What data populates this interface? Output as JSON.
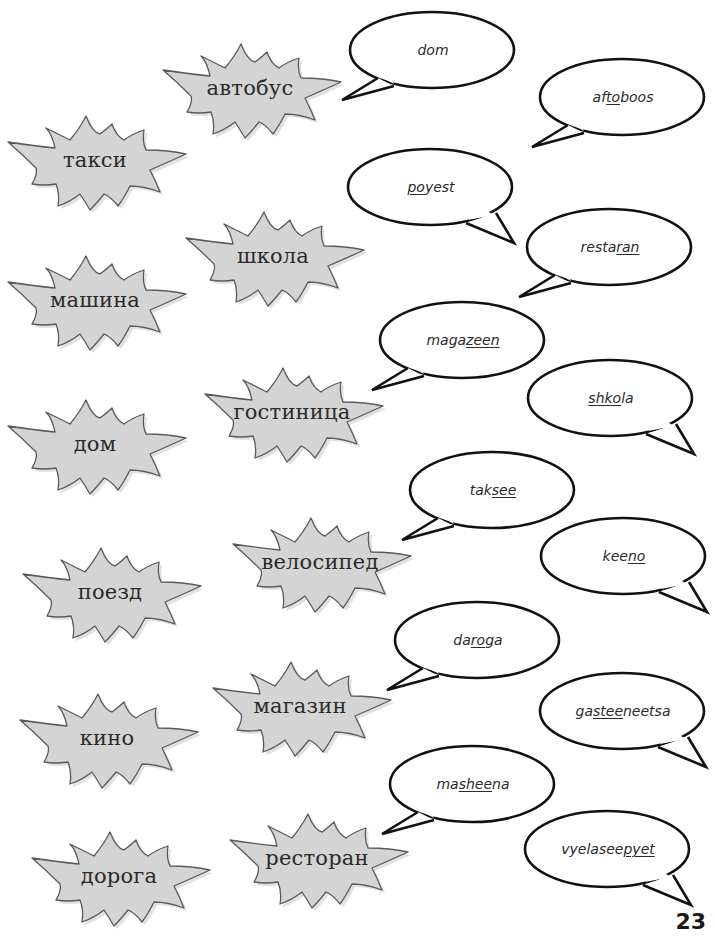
{
  "page": {
    "number": "23",
    "colors": {
      "star_fill": "#d4d4d4",
      "star_stroke": "#5a5a5a",
      "bubble_fill": "#ffffff",
      "bubble_stroke": "#111111",
      "text": "#2b2b2b"
    }
  },
  "russian_words": [
    {
      "text": "автобус",
      "x": 155,
      "y": 38
    },
    {
      "text": "такси",
      "x": 0,
      "y": 110
    },
    {
      "text": "школа",
      "x": 178,
      "y": 206
    },
    {
      "text": "машина",
      "x": 0,
      "y": 250
    },
    {
      "text": "гостиница",
      "x": 197,
      "y": 362
    },
    {
      "text": "дом",
      "x": 0,
      "y": 394
    },
    {
      "text": "велосипед",
      "x": 225,
      "y": 512
    },
    {
      "text": "поезд",
      "x": 15,
      "y": 542
    },
    {
      "text": "магазин",
      "x": 205,
      "y": 656
    },
    {
      "text": "кино",
      "x": 12,
      "y": 688
    },
    {
      "text": "ресторан",
      "x": 222,
      "y": 808
    },
    {
      "text": "дорога",
      "x": 24,
      "y": 826
    }
  ],
  "pronunciations": [
    {
      "parts": [
        {
          "t": "dom",
          "u": false
        }
      ],
      "x": 348,
      "y": 10,
      "tail": "left"
    },
    {
      "parts": [
        {
          "t": "af",
          "u": false
        },
        {
          "t": "to",
          "u": true
        },
        {
          "t": "boos",
          "u": false
        }
      ],
      "x": 538,
      "y": 57,
      "tail": "left"
    },
    {
      "parts": [
        {
          "t": "po",
          "u": true
        },
        {
          "t": "yest",
          "u": false
        }
      ],
      "x": 346,
      "y": 147,
      "tail": "right"
    },
    {
      "parts": [
        {
          "t": "resta",
          "u": false
        },
        {
          "t": "ran",
          "u": true
        }
      ],
      "x": 525,
      "y": 207,
      "tail": "left"
    },
    {
      "parts": [
        {
          "t": "maga",
          "u": false
        },
        {
          "t": "zeen",
          "u": true
        }
      ],
      "x": 378,
      "y": 300,
      "tail": "left"
    },
    {
      "parts": [
        {
          "t": "shko",
          "u": true
        },
        {
          "t": "la",
          "u": false
        }
      ],
      "x": 526,
      "y": 358,
      "tail": "right"
    },
    {
      "parts": [
        {
          "t": "tak",
          "u": false
        },
        {
          "t": "see",
          "u": true
        }
      ],
      "x": 408,
      "y": 450,
      "tail": "left"
    },
    {
      "parts": [
        {
          "t": "kee",
          "u": false
        },
        {
          "t": "no",
          "u": true
        }
      ],
      "x": 539,
      "y": 516,
      "tail": "right"
    },
    {
      "parts": [
        {
          "t": "da",
          "u": false
        },
        {
          "t": "ro",
          "u": true
        },
        {
          "t": "ga",
          "u": false
        }
      ],
      "x": 393,
      "y": 600,
      "tail": "left"
    },
    {
      "parts": [
        {
          "t": "ga",
          "u": false
        },
        {
          "t": "stee",
          "u": true
        },
        {
          "t": "neetsa",
          "u": false
        }
      ],
      "x": 538,
      "y": 671,
      "tail": "right"
    },
    {
      "parts": [
        {
          "t": "ma",
          "u": false
        },
        {
          "t": "shee",
          "u": true
        },
        {
          "t": "na",
          "u": false
        }
      ],
      "x": 388,
      "y": 744,
      "tail": "left"
    },
    {
      "parts": [
        {
          "t": "vyelasee",
          "u": false
        },
        {
          "t": "pyet",
          "u": true
        }
      ],
      "x": 523,
      "y": 809,
      "tail": "right"
    }
  ]
}
